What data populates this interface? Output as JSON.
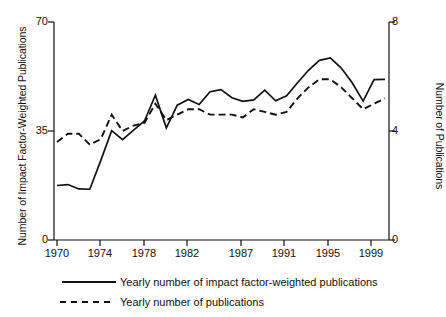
{
  "chart_data": {
    "type": "line",
    "title": "",
    "xlabel": "",
    "ylabel": "Number of Impact Factor-Weighted Publications",
    "ylabel_right": "Number of Publications",
    "xlim": [
      1970,
      2000
    ],
    "ylim": [
      0,
      70
    ],
    "ylim_right": [
      0,
      8
    ],
    "yticks": [
      0,
      35,
      70
    ],
    "yticks_right": [
      0,
      4,
      8
    ],
    "xticks": [
      1970,
      1974,
      1978,
      1982,
      1987,
      1991,
      1995,
      1999
    ],
    "xticklabels": [
      "1970",
      "1974",
      "1978",
      "1982",
      "1987",
      "1991",
      "1995",
      "1999"
    ],
    "grid": false,
    "legend_position": "below",
    "x": [
      1970,
      1971,
      1972,
      1973,
      1974,
      1975,
      1976,
      1977,
      1978,
      1979,
      1980,
      1981,
      1982,
      1983,
      1984,
      1985,
      1986,
      1987,
      1988,
      1989,
      1990,
      1991,
      1992,
      1993,
      1994,
      1995,
      1996,
      1997,
      1998,
      1999,
      2000
    ],
    "series": [
      {
        "name": "Yearly number of impact factor-weighted publications",
        "axis": "left",
        "style": "solid",
        "color": "#111111",
        "values": [
          17.5,
          17.8,
          16.4,
          16.3,
          25.5,
          35.1,
          32.2,
          35.3,
          38.2,
          46.5,
          36.0,
          43.3,
          45.1,
          43.5,
          47.6,
          48.3,
          45.7,
          44.5,
          45.0,
          48.1,
          44.7,
          46.3,
          50.5,
          54.5,
          57.7,
          58.5,
          55.2,
          50.5,
          44.6,
          51.5,
          51.6
        ]
      },
      {
        "name": "Yearly number of publications",
        "axis": "right",
        "style": "dashed",
        "color": "#111111",
        "values": [
          3.6,
          3.9,
          3.9,
          3.5,
          3.7,
          4.6,
          4.0,
          4.2,
          4.3,
          5.0,
          4.4,
          4.6,
          4.8,
          4.8,
          4.6,
          4.6,
          4.6,
          4.5,
          4.8,
          4.7,
          4.6,
          4.7,
          5.2,
          5.6,
          5.9,
          5.9,
          5.6,
          5.2,
          4.8,
          5.0,
          5.2
        ]
      }
    ]
  },
  "axes": {
    "left_title": "Number of Impact Factor-Weighted Publications",
    "right_title": "Number of Publications",
    "left_ticks": [
      "70",
      "35",
      "0"
    ],
    "right_ticks": [
      "8",
      "4",
      "0"
    ],
    "x_ticks": [
      "1970",
      "1974",
      "1978",
      "1982",
      "1987",
      "1991",
      "1995",
      "1999"
    ]
  },
  "legend": {
    "items": [
      {
        "label": "Yearly number of impact factor-weighted publications",
        "style": "solid"
      },
      {
        "label": "Yearly number of publications",
        "style": "dashed"
      }
    ]
  }
}
